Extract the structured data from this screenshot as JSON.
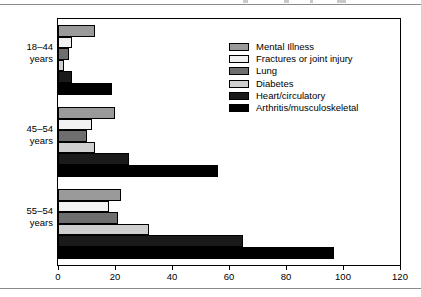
{
  "chart_data": {
    "type": "bar",
    "orientation": "horizontal",
    "title": "",
    "xlabel": "",
    "ylabel": "",
    "xlim": [
      0,
      120
    ],
    "xticks": [
      0,
      20,
      40,
      60,
      80,
      100,
      120
    ],
    "xtick_labels": [
      "0",
      "20",
      "40",
      "60",
      "80",
      "100",
      "120"
    ],
    "grid": false,
    "legend_position": "upper right",
    "categories": [
      "18–44 years",
      "45–54 years",
      "55–54 years"
    ],
    "category_lines": [
      [
        "18–44",
        "years"
      ],
      [
        "45–54",
        "years"
      ],
      [
        "55–54",
        "years"
      ]
    ],
    "series": [
      {
        "name": "Mental Illness",
        "color": "#9a9a9a",
        "values": [
          13,
          20,
          22
        ]
      },
      {
        "name": "Fractures or joint injury",
        "color": "#f2f2f2",
        "values": [
          5,
          12,
          18
        ]
      },
      {
        "name": "Lung",
        "color": "#6e6e6e",
        "values": [
          4,
          10,
          21
        ]
      },
      {
        "name": "Diabetes",
        "color": "#cfcfcf",
        "values": [
          2,
          13,
          32
        ]
      },
      {
        "name": "Heart/circulatory",
        "color": "#1a1a1a",
        "values": [
          5,
          25,
          65
        ]
      },
      {
        "name": "Arthritis/musculoskeletal",
        "color": "#000000",
        "values": [
          19,
          56,
          97
        ]
      }
    ]
  },
  "legend": {
    "items": [
      {
        "label": "Mental Illness"
      },
      {
        "label": "Fractures or joint injury"
      },
      {
        "label": "Lung"
      },
      {
        "label": "Diabetes"
      },
      {
        "label": "Heart/circulatory"
      },
      {
        "label": "Arthritis/musculoskeletal"
      }
    ]
  },
  "colors": {
    "mental_illness": "#9a9a9a",
    "fractures": "#f2f2f2",
    "lung": "#6e6e6e",
    "diabetes": "#cfcfcf",
    "heart": "#1a1a1a",
    "arthritis": "#000000",
    "axis": "#000000",
    "rule": "#8a8a8a"
  }
}
